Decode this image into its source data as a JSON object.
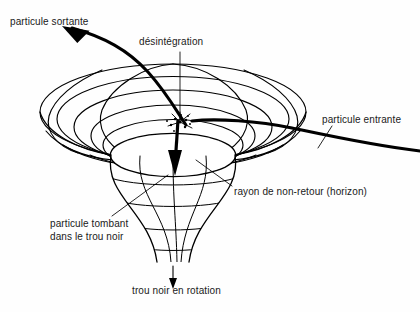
{
  "figure": {
    "background_color": "#fefefe",
    "ink_color": "#000000",
    "width": 420,
    "height": 312
  },
  "labels": {
    "outgoing_particle": "particule sortante",
    "disintegration": "désintégration",
    "incoming_particle": "particule entrante",
    "horizon_radius": "rayon de non-retour (horizon)",
    "falling_particle_line1": "particule tombant",
    "falling_particle_line2": "dans le trou noir",
    "rotating_black_hole": "trou noir en rotation"
  },
  "annotations": {
    "outgoing_particle": {
      "text": "particule sortante",
      "x": 10,
      "y": 22,
      "leader": "curved-arrow-up-left"
    },
    "disintegration": {
      "text": "désintégration",
      "x": 139,
      "y": 40,
      "leader": "vertical-line-down"
    },
    "incoming_particle": {
      "text": "particule entrante",
      "x": 322,
      "y": 120,
      "leader": "short-diagonal-line"
    },
    "horizon_radius": {
      "text": "rayon de non-retour (horizon)",
      "x": 234,
      "y": 190,
      "leader": "diagonal-line-up-left"
    },
    "falling_particle": {
      "text": "particule tombant dans le trou noir",
      "x": 50,
      "y": 224,
      "leader": "diagonal-line-up-right"
    },
    "rotating_black_hole": {
      "text": "trou noir en rotation",
      "x": 132,
      "y": 285,
      "leader": "vertical-arrow-down"
    }
  },
  "icons": {
    "disintegration_burst": "starburst-icon",
    "infall_arrow": "arrow-down-icon",
    "rotation_arrow": "arrow-down-icon",
    "escape_arrow": "arrow-up-left-icon"
  },
  "geometry": {
    "funnel_center_x": 173,
    "rim_center_y": 112,
    "rim_radius_x": 133,
    "rim_radius_y": 48,
    "horizon_radius_x": 62,
    "horizon_radius_y": 21,
    "horizon_center_y": 155,
    "throat_bottom_y": 262,
    "throat_half_width": 16
  }
}
